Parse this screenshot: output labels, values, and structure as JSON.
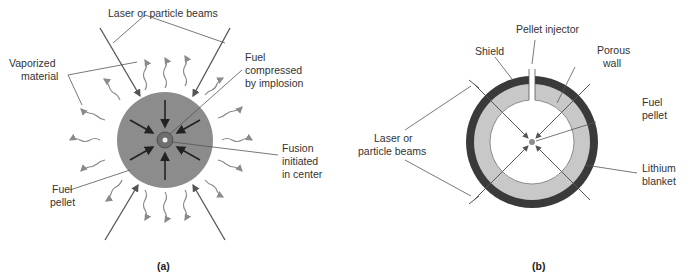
{
  "diagram_a": {
    "caption": "(a)",
    "labels": {
      "beams": "Laser or particle beams",
      "vaporized_1": "Vaporized",
      "vaporized_2": "material",
      "compressed_1": "Fuel",
      "compressed_2": "compressed",
      "compressed_3": "by implosion",
      "fusion_1": "Fusion",
      "fusion_2": "initiated",
      "fusion_3": "in center",
      "pellet_1": "Fuel",
      "pellet_2": "pellet"
    },
    "colors": {
      "pellet": "#8c8c8c",
      "core": "#6e6e6e",
      "arrows": "#222222",
      "wavy": "#8a8a8a"
    }
  },
  "diagram_b": {
    "caption": "(b)",
    "labels": {
      "injector": "Pellet injector",
      "shield": "Shield",
      "porous_1": "Porous",
      "porous_2": "wall",
      "pellet_1": "Fuel",
      "pellet_2": "pellet",
      "beams_1": "Laser or",
      "beams_2": "particle beams",
      "lithium_1": "Lithium",
      "lithium_2": "blanket"
    },
    "colors": {
      "shield": "#3a3a3a",
      "blanket": "#c8c8c8",
      "pellet": "#8c8c8c"
    }
  }
}
